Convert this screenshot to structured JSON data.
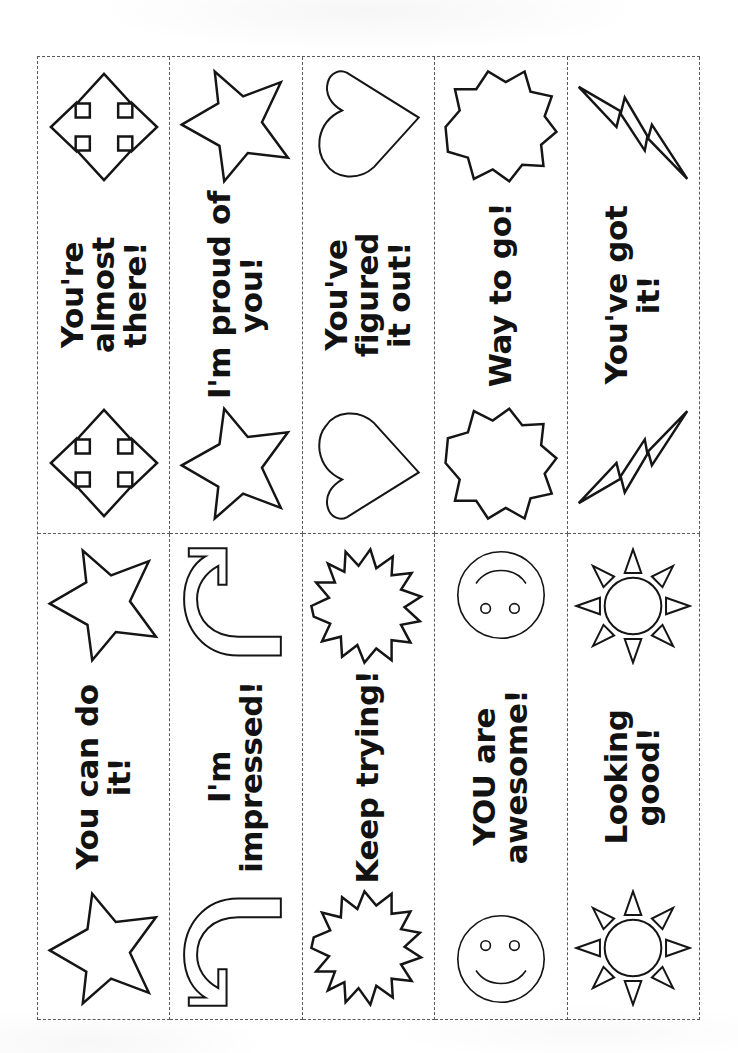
{
  "document": {
    "kind": "printable-encouragement-cards-worksheet",
    "orientation": "sideways",
    "grid": {
      "columns": 5,
      "rows": 2
    },
    "background_color": "#ffffff",
    "ink_color": "#151515",
    "cut_line_color": "#5a5a5a"
  },
  "cards": [
    {
      "id": "card-youre-almost-there",
      "label": "You're almost there!",
      "art": "four-way-arrow-icon",
      "art_label": "four-way-arrow"
    },
    {
      "id": "card-im-proud-of-you",
      "label": "I'm proud of you!",
      "art": "star-icon",
      "art_label": "star"
    },
    {
      "id": "card-youve-figured-it-out",
      "label": "You've figured\nit out!",
      "art": "heart-icon",
      "art_label": "heart"
    },
    {
      "id": "card-way-to-go",
      "label": "Way to go!",
      "art": "starburst-icon",
      "art_label": "starburst"
    },
    {
      "id": "card-youve-got-it",
      "label": "You've got it!",
      "art": "lightning-bolt-icon",
      "art_label": "lightning-bolt"
    },
    {
      "id": "card-you-can-do-it",
      "label": "You can do it!",
      "art": "star-icon",
      "art_label": "star"
    },
    {
      "id": "card-im-impressed",
      "label": "I'm impressed!",
      "art": "curved-arrow-icon",
      "art_label": "curved-arrow"
    },
    {
      "id": "card-keep-trying",
      "label": "Keep trying!",
      "art": "explosion-icon",
      "art_label": "explosion-star"
    },
    {
      "id": "card-you-are-awesome",
      "label": "YOU are awesome!",
      "art": "smiley-face-icon",
      "art_label": "smiley-face"
    },
    {
      "id": "card-looking-good",
      "label": "Looking good!",
      "art": "sun-icon",
      "art_label": "sun"
    }
  ]
}
